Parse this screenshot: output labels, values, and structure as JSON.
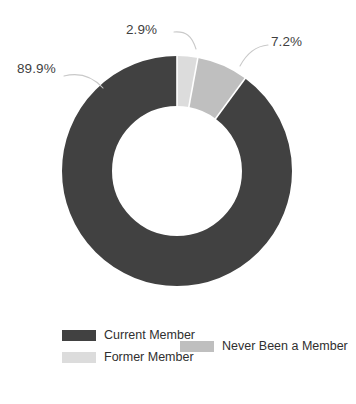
{
  "chart_data": {
    "type": "pie",
    "variant": "donut",
    "title": "",
    "subtitle": "",
    "xlabel": "",
    "ylabel": "",
    "categories": [
      "Current Member",
      "Former Member",
      "Never Been a Member"
    ],
    "values": [
      89.9,
      2.9,
      7.2
    ],
    "value_unit": "%",
    "data_labels": [
      "89.9%",
      "2.9%",
      "7.2%"
    ],
    "colors": [
      "#414141",
      "#dcdcdc",
      "#bfbfbf"
    ],
    "legend": {
      "position": "bottom",
      "entries": [
        {
          "label": "Current Member",
          "color": "#414141"
        },
        {
          "label": "Former Member",
          "color": "#dcdcdc"
        },
        {
          "label": "Never Been a Member",
          "color": "#bfbfbf"
        }
      ]
    },
    "geometry": {
      "center_x": 177,
      "center_y": 171,
      "outer_radius": 115,
      "inner_radius": 65,
      "start_angle_deg": 0,
      "direction": "clockwise"
    },
    "slices": [
      {
        "name": "Former Member",
        "value": 2.9,
        "label": "2.9%",
        "color": "#dcdcdc",
        "start_pct": 0.0,
        "end_pct": 2.9
      },
      {
        "name": "Never Been a Member",
        "value": 7.2,
        "label": "7.2%",
        "color": "#bfbfbf",
        "start_pct": 2.9,
        "end_pct": 10.1
      },
      {
        "name": "Current Member",
        "value": 89.9,
        "label": "89.9%",
        "color": "#414141",
        "start_pct": 10.1,
        "end_pct": 100.0
      }
    ],
    "grid": false,
    "background_color": "#ffffff",
    "label_text_color": "#3f3f3f",
    "leader_line_color": "#c9c9c9"
  },
  "labels": {
    "major": "89.9%",
    "former": "2.9%",
    "never": "7.2%"
  },
  "legend": {
    "items": [
      {
        "label": "Current Member"
      },
      {
        "label": "Former Member"
      },
      {
        "label": "Never Been a Member"
      }
    ]
  }
}
